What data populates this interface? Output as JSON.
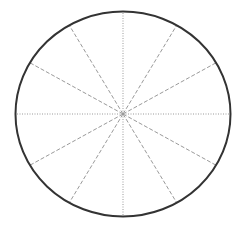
{
  "diagram": {
    "title": "",
    "shape": "circle divided into 12 equal sectors",
    "center": [
      123,
      114
    ],
    "radius_x": 107.5,
    "radius_y": 102.5,
    "outline_color": "#333333",
    "spoke_color": "#9a9a9a",
    "spokes": [
      {
        "angle_deg": 0,
        "style": "dotted"
      },
      {
        "angle_deg": 30,
        "style": "dashed"
      },
      {
        "angle_deg": 60,
        "style": "dashed"
      },
      {
        "angle_deg": 90,
        "style": "dotted"
      },
      {
        "angle_deg": 120,
        "style": "dashed"
      },
      {
        "angle_deg": 150,
        "style": "dashed"
      },
      {
        "angle_deg": 180,
        "style": "dotted"
      },
      {
        "angle_deg": 210,
        "style": "dashed"
      },
      {
        "angle_deg": 240,
        "style": "dashed"
      },
      {
        "angle_deg": 270,
        "style": "dotted"
      },
      {
        "angle_deg": 300,
        "style": "dashed"
      },
      {
        "angle_deg": 330,
        "style": "dashed"
      }
    ]
  }
}
